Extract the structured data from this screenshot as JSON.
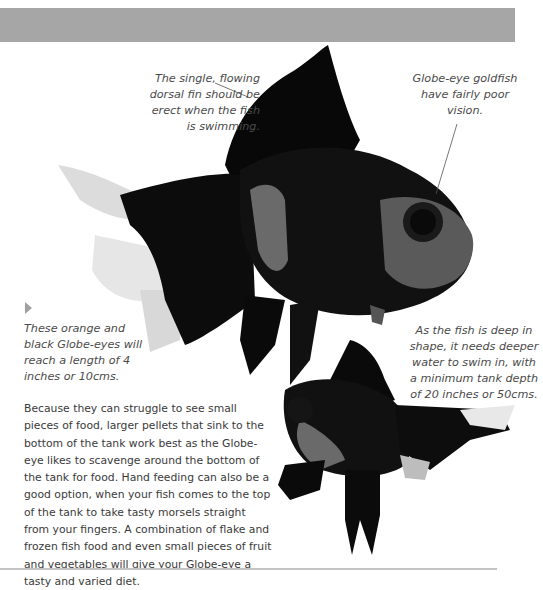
{
  "page": {
    "header_bar_color": "#a6a6a6",
    "footer_rule_color": "#c4c4c4"
  },
  "captions": {
    "dorsal_fin": "The single, flowing dorsal fin should be erect when the fish is swimming.",
    "vision": "Globe-eye goldfish have fairly poor vision.",
    "length": "These orange and black Globe-eyes will reach a length of 4 inches or 10cms.",
    "tank_depth": "As the fish is deep in shape, it needs deeper water to swim in, with a minimum tank depth of 20 inches or 50cms."
  },
  "body": {
    "paragraph": "Because they can struggle to see small pieces of food, larger pellets that sink to the bottom of the tank work best as the Globe-eye likes to scavenge around the bottom of the tank for food.  Hand feeding can also be a good option, when your fish comes to the top of the tank to take tasty morsels straight from your fingers. A combination of flake and frozen fish food and even small pieces of fruit and vegetables will give your Globe-eye a tasty and varied diet."
  },
  "images": {
    "main_fish": "Black Globe-eye goldfish (side view)",
    "small_fish": "Black Globe-eye goldfish (front view)"
  },
  "icons": {
    "marker": "triangle-right-icon"
  }
}
